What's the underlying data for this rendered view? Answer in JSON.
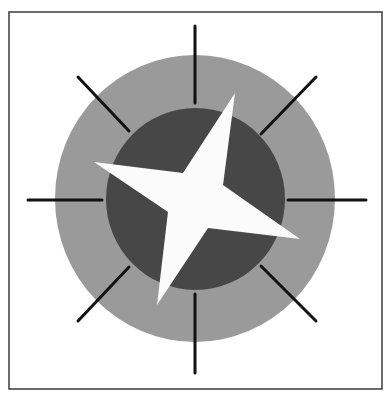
{
  "figure": {
    "frame": {
      "x": 9,
      "y": 12,
      "width": 373,
      "height": 377,
      "stroke": "#3a3a3a",
      "stroke_width": 1.5
    },
    "outer_circle": {
      "cx": 195,
      "cy": 198.5,
      "rx": 140,
      "ry": 143.5,
      "fill": "#9a9a9a"
    },
    "inner_circle": {
      "cx": 195.5,
      "cy": 199,
      "rx": 89.5,
      "ry": 91,
      "fill": "#474747"
    },
    "ticks": {
      "color": "#111111",
      "width": 3,
      "lines": [
        {
          "name": "tick-north",
          "x1": 195,
          "y1": 26,
          "x2": 195,
          "y2": 103
        },
        {
          "name": "tick-south",
          "x1": 195,
          "y1": 294,
          "x2": 195,
          "y2": 373
        },
        {
          "name": "tick-west",
          "x1": 28,
          "y1": 200,
          "x2": 102,
          "y2": 200
        },
        {
          "name": "tick-east",
          "x1": 288,
          "y1": 200,
          "x2": 366,
          "y2": 200
        },
        {
          "name": "tick-northwest",
          "x1": 78,
          "y1": 77,
          "x2": 129,
          "y2": 131
        },
        {
          "name": "tick-northeast",
          "x1": 316,
          "y1": 77,
          "x2": 261,
          "y2": 134
        },
        {
          "name": "tick-southwest",
          "x1": 129,
          "y1": 267,
          "x2": 78,
          "y2": 321
        },
        {
          "name": "tick-southeast",
          "x1": 261,
          "y1": 266,
          "x2": 316,
          "y2": 321
        }
      ]
    },
    "star": {
      "fill": "#fbfbfb",
      "points": "235,93 223,185 300,239 208,228 157,305 168,212 94,162 183,173"
    }
  }
}
